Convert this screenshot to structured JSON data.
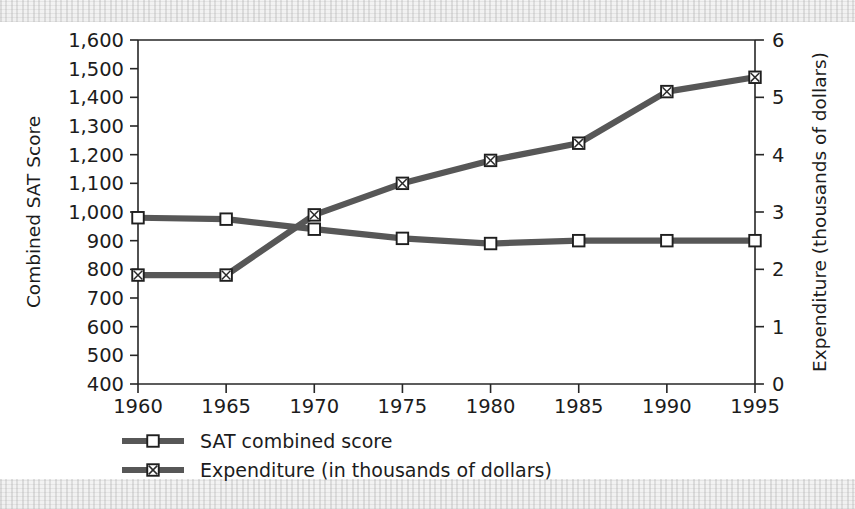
{
  "chart_data": {
    "type": "line",
    "title": "",
    "xlabel": "",
    "ylabel": "Combined SAT Score",
    "y2label": "Expenditure (thousands of dollars)",
    "categories": [
      1960,
      1965,
      1970,
      1975,
      1980,
      1985,
      1990,
      1995
    ],
    "x_tick_labels": [
      "1960",
      "1965",
      "1970",
      "1975",
      "1980",
      "1985",
      "1990",
      "1995"
    ],
    "xlim": [
      1960,
      1995
    ],
    "ylim": [
      400,
      1600
    ],
    "y2lim": [
      0,
      6
    ],
    "y_tick_labels": [
      "1,600",
      "1,500",
      "1,400",
      "1,300",
      "1,200",
      "1,100",
      "1,000",
      "900",
      "800",
      "700",
      "600",
      "500",
      "400"
    ],
    "y_tick_values": [
      1600,
      1500,
      1400,
      1300,
      1200,
      1100,
      1000,
      900,
      800,
      700,
      600,
      500,
      400
    ],
    "y2_tick_labels": [
      "6",
      "5",
      "4",
      "3",
      "2",
      "1",
      "0"
    ],
    "y2_tick_values": [
      6,
      5,
      4,
      3,
      2,
      1,
      0
    ],
    "grid": false,
    "legend_position": "below-left",
    "series": [
      {
        "name": "SAT combined score",
        "axis": "left",
        "marker": "open-square",
        "values": [
          980,
          975,
          940,
          908,
          890,
          900,
          900,
          900
        ]
      },
      {
        "name": "Expenditure (in thousands of dollars)",
        "axis": "right",
        "marker": "crossed-square",
        "values": [
          1.9,
          1.9,
          2.95,
          3.5,
          3.9,
          4.2,
          5.1,
          5.35
        ]
      }
    ]
  },
  "legend": {
    "items": [
      {
        "label": "SAT combined score",
        "marker": "open-square"
      },
      {
        "label": "Expenditure (in thousands of dollars)",
        "marker": "crossed-square"
      }
    ]
  },
  "colors": {
    "line": "#575757",
    "axis": "#262626",
    "text": "#1c1c1c",
    "background": "#ffffff"
  }
}
